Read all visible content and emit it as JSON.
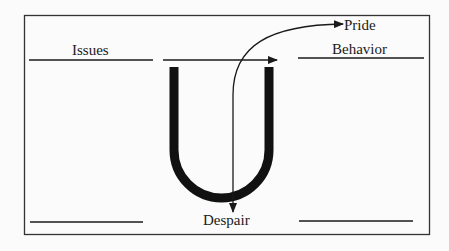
{
  "diagram": {
    "labels": {
      "issues": "Issues",
      "pride": "Pride",
      "behavior": "Behavior",
      "despair": "Despair"
    },
    "blank_lines": {
      "top_left": "",
      "bottom_left": "",
      "bottom_right": "",
      "top_right": ""
    },
    "shapes": {
      "u_curve": "U",
      "horizontal_arrow": "right-arrow",
      "curved_arrow": "down-then-up-arrow"
    },
    "colors": {
      "background": "#fbfbfb",
      "stroke": "#1a1a1a",
      "frame": "#333333"
    }
  }
}
